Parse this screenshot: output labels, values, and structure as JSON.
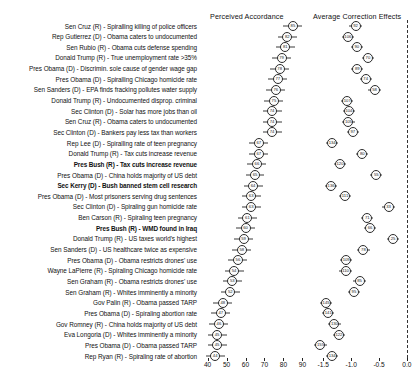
{
  "figure": {
    "panels": [
      {
        "name": "perceived-accordance",
        "title": "Perceived Accordance"
      },
      {
        "name": "average-correction-effects",
        "title": "Average Correction Effects"
      }
    ]
  },
  "chart_data": {
    "type": "scatter",
    "title": "",
    "subtitle": "",
    "orientation": "horizontal",
    "grid": false,
    "legend": null,
    "panels": [
      {
        "name": "perceived-accordance",
        "title": "Perceived Accordance",
        "xlabel": "",
        "ylabel": "",
        "xlim": [
          36,
          94
        ],
        "xticks": [
          40,
          50,
          60,
          70,
          80,
          90
        ],
        "xticklabels": [
          "40",
          "50",
          "60",
          "70",
          "80",
          "90"
        ],
        "marker": "labeled-circle",
        "error_bars": "horizontal"
      },
      {
        "name": "average-correction-effects",
        "title": "Average Correction Effects",
        "xlabel": "",
        "ylabel": "",
        "xlim": [
          -1.72,
          0.18
        ],
        "xticks": [
          -1.5,
          -1.0,
          -0.5,
          0.0
        ],
        "xticklabels": [
          "-1.5",
          "-1.0",
          "-0.5",
          "0.0"
        ],
        "marker": "labeled-circle",
        "error_bars": "horizontal",
        "reference_line": {
          "value": 0.0,
          "style": "dashed"
        }
      }
    ],
    "categories": [
      "Sen Cruz (R) - Spiralling killing of police officers",
      "Rep Gutierrez (D) - Obama caters to undocumented",
      "Sen Rubio (R) - Obama cuts defense spending",
      "Donald Trump (R) - True unemployment rate >35%",
      "Pres Obama (D) - Discrimin. sole cause of gender wage gap",
      "Pres Obama (D) - Spiralling Chicago homicide rate",
      "Sen Sanders (D) - EPA finds fracking pollutes water supply",
      "Donald Trump (R) - Undocumented disprop. criminal",
      "Sec Clinton (D) - Solar has more jobs than oil",
      "Sen Cruz (R) - Obama caters to undocumented",
      "Sec Clinton (D) - Bankers pay less tax than workers",
      "Rep Lee (D) - Spiralling rate of teen pregnancy",
      "Donald Trump (R) - Tax cuts increase revenue",
      "Pres Bush (R) - Tax cuts increase revenue",
      "Pres Obama (D) - China holds majority of US debt",
      "Sec Kerry (D) - Bush banned stem cell research",
      "Pres Obama (D) - Most prisoners serving drug sentences",
      "Sec Clinton (D) - Spiraling gun homicide rate",
      "Ben Carson (R) - Spiraling teen pregnancy",
      "Pres Bush (R) - WMD found in Iraq",
      "Donald Trump (R) - US taxes world's highest",
      "Sen Sanders (D) - US healthcare twice as expensive",
      "Pres Obama (D) - Obama restricts drones' use",
      "Wayne LaPierre (R) - Spiraling Chicago homicide rate",
      "Sen Graham (R) - Obama restricts drones' use",
      "Sen Graham (R) - Whites imminently a minority",
      "Gov Palin (R) - Obama passed TARP",
      "Pres Obama (D) - Spiraling abortion rate",
      "Gov Romney (R) - China holds majority of US debt",
      "Eva Longoria (D) - Whites imminently a minority",
      "Pres Obama (D) - Obama passed TARP",
      "Rep Ryan (R) - Spiraling rate of abortion"
    ],
    "bold_categories": [
      "Pres Bush (R) - Tax cuts increase revenue",
      "Sec Kerry (D) - Bush banned stem cell research",
      "Pres Bush (R) - WMD found in Iraq"
    ],
    "series": [
      {
        "name": "Perceived Accordance",
        "panel": "perceived-accordance",
        "values": [
          85,
          82,
          81,
          79,
          78,
          77,
          76,
          75,
          74,
          74,
          74,
          67,
          67,
          66,
          65,
          64,
          63,
          63,
          61,
          60,
          59,
          58,
          56,
          54,
          53,
          52,
          48,
          47,
          46,
          45,
          45,
          44
        ],
        "ci_low": [
          80,
          77,
          76,
          74,
          73,
          72,
          71,
          70,
          69,
          69,
          69,
          62,
          62,
          61,
          60,
          59,
          58,
          58,
          56,
          55,
          54,
          53,
          51,
          49,
          48,
          47,
          43,
          42,
          41,
          40,
          40,
          39
        ],
        "ci_high": [
          90,
          87,
          86,
          84,
          83,
          82,
          81,
          80,
          79,
          79,
          79,
          72,
          72,
          71,
          70,
          69,
          68,
          68,
          66,
          65,
          64,
          63,
          61,
          59,
          58,
          57,
          53,
          52,
          51,
          50,
          50,
          49
        ]
      },
      {
        "name": "Average Correction Effects",
        "panel": "average-correction-effects",
        "values": [
          -0.92,
          -1.06,
          -0.9,
          -0.7,
          -0.89,
          -0.74,
          -0.58,
          -1.07,
          -1.04,
          -1.05,
          -0.97,
          -1.34,
          -0.8,
          -1.2,
          -0.55,
          -1.36,
          -1.11,
          -0.33,
          -0.71,
          -0.66,
          -0.25,
          -0.78,
          -1.09,
          -1.1,
          -0.85,
          -0.95,
          -1.45,
          -1.41,
          -1.3,
          -1.22,
          -1.55,
          -1.34
        ],
        "ci_low": [
          -1.03,
          -1.17,
          -1.01,
          -0.81,
          -1.0,
          -0.85,
          -0.69,
          -1.18,
          -1.15,
          -1.16,
          -1.08,
          -1.45,
          -0.91,
          -1.31,
          -0.66,
          -1.47,
          -1.22,
          -0.44,
          -0.82,
          -0.77,
          -0.36,
          -0.89,
          -1.2,
          -1.21,
          -0.96,
          -1.06,
          -1.56,
          -1.52,
          -1.41,
          -1.33,
          -1.66,
          -1.45
        ],
        "ci_high": [
          -0.81,
          -0.95,
          -0.79,
          -0.59,
          -0.78,
          -0.63,
          -0.47,
          -0.96,
          -0.93,
          -0.94,
          -0.86,
          -1.23,
          -0.69,
          -1.09,
          -0.44,
          -1.25,
          -1.0,
          -0.22,
          -0.6,
          -0.55,
          -0.14,
          -0.67,
          -0.98,
          -0.99,
          -0.74,
          -0.84,
          -1.34,
          -1.3,
          -1.19,
          -1.11,
          -1.44,
          -1.23
        ]
      }
    ]
  }
}
